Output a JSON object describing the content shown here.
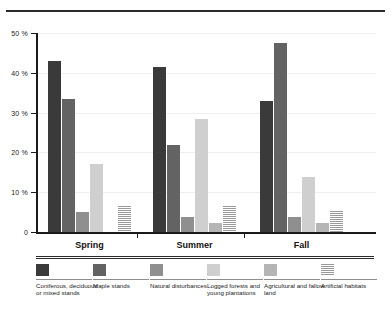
{
  "figure": {
    "top_rule": "horizontal-rule"
  },
  "chart_data": {
    "type": "bar",
    "title": "",
    "subtitle": "",
    "xlabel": "",
    "ylabel": "",
    "ylim": [
      0,
      50
    ],
    "yticks": [
      0,
      10,
      20,
      30,
      40,
      50
    ],
    "ytick_labels": [
      "0",
      "10 %",
      "20 %",
      "30 %",
      "40 %",
      "50 %"
    ],
    "grid": true,
    "legend_position": "bottom",
    "categories": [
      "Spring",
      "Summer",
      "Fall"
    ],
    "series": [
      {
        "name": "Coniferous, deciduous or mixed stands",
        "color": "#3a3a3a",
        "values": [
          43.0,
          41.5,
          32.8
        ]
      },
      {
        "name": "Maple stands",
        "color": "#636363",
        "values": [
          33.5,
          21.8,
          47.5
        ]
      },
      {
        "name": "Natural disturbances",
        "color": "#8f8f8f",
        "values": [
          5.0,
          3.8,
          3.8
        ]
      },
      {
        "name": "Logged forests and young plantations",
        "color": "#cfcfcf",
        "values": [
          17.0,
          28.3,
          13.7
        ]
      },
      {
        "name": "Agricultural and fallow land",
        "color": "#b5b5b5",
        "values": [
          0.0,
          2.2,
          2.2
        ]
      },
      {
        "name": "Artificial habitats",
        "color": "#9a9a9a",
        "values": [
          6.5,
          6.5,
          5.4
        ]
      }
    ]
  },
  "legend": {
    "items": [
      {
        "label": "Coniferous, deciduous or mixed stands",
        "swatch": "coniferous"
      },
      {
        "label": "Maple stands",
        "swatch": "maple"
      },
      {
        "label": "Natural disturbances",
        "swatch": "natural"
      },
      {
        "label": "Logged forests and young plantations",
        "swatch": "logged"
      },
      {
        "label": "Agricultural and fallow land",
        "swatch": "agricultural"
      },
      {
        "label": "Artificial habitats",
        "swatch": "artificial"
      }
    ]
  }
}
